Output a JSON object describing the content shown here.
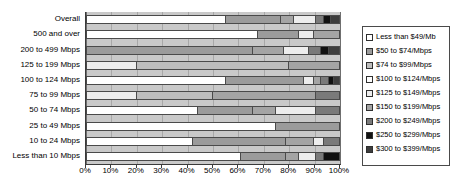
{
  "chart_data": {
    "type": "bar",
    "orientation": "horizontal",
    "stacked": true,
    "normalized": "100%",
    "title": "",
    "xlabel": "",
    "ylabel": "",
    "xlim": [
      0,
      100
    ],
    "grid": true,
    "legend_position": "right",
    "categories": [
      "Overall",
      "500 and over",
      "200 to 499 Mbps",
      "125 to 199 Mbps",
      "100 to 124 Mbps",
      "75 to 99 Mbps",
      "50 to 74 Mbps",
      "25 to 49 Mbps",
      "10 to 24 Mbps",
      "Less than 10 Mbps"
    ],
    "xticklabels": [
      "0%",
      "10%",
      "20%",
      "30%",
      "40%",
      "50%",
      "60%",
      "70%",
      "80%",
      "90%",
      "100%"
    ],
    "xtickvalues": [
      0,
      10,
      20,
      30,
      40,
      50,
      60,
      70,
      80,
      90,
      100
    ],
    "series": [
      {
        "name": "Less than $49/Mb",
        "fill": "f0",
        "values": [
          55,
          68,
          0,
          0,
          55,
          0,
          44,
          75,
          0,
          61
        ]
      },
      {
        "name": "$50 to $74/Mbps",
        "fill": "f1",
        "values": [
          22,
          16,
          66,
          0,
          31,
          0,
          22,
          25,
          42,
          18
        ]
      },
      {
        "name": "$74 to $99/Mbps",
        "fill": "f2",
        "values": [
          0,
          0,
          0,
          20,
          0,
          20,
          0,
          0,
          0,
          0
        ]
      },
      {
        "name": "$100 to $124/Mbps",
        "fill": "f3",
        "values": [
          0,
          0,
          0,
          0,
          0,
          0,
          0,
          0,
          0,
          0
        ]
      },
      {
        "name": "$125 to $149/Mbps",
        "fill": "f4",
        "values": [
          9,
          6,
          10,
          60,
          4,
          30,
          0,
          0,
          37,
          5
        ]
      },
      {
        "name": "$150 to $199/Mbps",
        "fill": "f5",
        "values": [
          5,
          10,
          12,
          20,
          3,
          41,
          9,
          0,
          11,
          7
        ]
      },
      {
        "name": "$200 to $249/Mbps",
        "fill": "f6",
        "values": [
          3,
          0,
          5,
          0,
          3,
          9,
          16,
          0,
          4,
          3
        ]
      },
      {
        "name": "$250 to $299/Mbps",
        "fill": "f7",
        "values": [
          3,
          0,
          3,
          0,
          2,
          0,
          9,
          0,
          6,
          6
        ]
      },
      {
        "name": "$300 to $399/Mbps",
        "fill": "f8",
        "values": [
          3,
          0,
          4,
          0,
          2,
          0,
          0,
          0,
          0,
          0
        ]
      }
    ],
    "bars": [
      {
        "category": "Overall",
        "segments": [
          {
            "s": 0,
            "v": 55
          },
          {
            "s": 1,
            "v": 22
          },
          {
            "s": 5,
            "v": 5
          },
          {
            "s": 4,
            "v": 9
          },
          {
            "s": 6,
            "v": 3
          },
          {
            "s": 7,
            "v": 3
          },
          {
            "s": 8,
            "v": 3
          }
        ]
      },
      {
        "category": "500 and over",
        "segments": [
          {
            "s": 0,
            "v": 68
          },
          {
            "s": 1,
            "v": 16
          },
          {
            "s": 4,
            "v": 6
          },
          {
            "s": 5,
            "v": 10
          }
        ]
      },
      {
        "category": "200 to 499 Mbps",
        "segments": [
          {
            "s": 1,
            "v": 66
          },
          {
            "s": 5,
            "v": 12
          },
          {
            "s": 4,
            "v": 10
          },
          {
            "s": 6,
            "v": 5
          },
          {
            "s": 7,
            "v": 3
          },
          {
            "s": 8,
            "v": 4
          }
        ]
      },
      {
        "category": "125 to 199 Mbps",
        "segments": [
          {
            "s": 4,
            "v": 20
          },
          {
            "s": 2,
            "v": 60
          },
          {
            "s": 5,
            "v": 20
          }
        ]
      },
      {
        "category": "100 to 124 Mbps",
        "segments": [
          {
            "s": 0,
            "v": 55
          },
          {
            "s": 1,
            "v": 31
          },
          {
            "s": 4,
            "v": 4
          },
          {
            "s": 5,
            "v": 3
          },
          {
            "s": 6,
            "v": 3
          },
          {
            "s": 7,
            "v": 2
          },
          {
            "s": 8,
            "v": 2
          }
        ]
      },
      {
        "category": "75 to 99 Mbps",
        "segments": [
          {
            "s": 4,
            "v": 20
          },
          {
            "s": 2,
            "v": 30
          },
          {
            "s": 5,
            "v": 41
          },
          {
            "s": 6,
            "v": 9
          }
        ]
      },
      {
        "category": "50 to 74 Mbps",
        "segments": [
          {
            "s": 0,
            "v": 44
          },
          {
            "s": 1,
            "v": 22
          },
          {
            "s": 5,
            "v": 9
          },
          {
            "s": 4,
            "v": 16
          },
          {
            "s": 6,
            "v": 9
          },
          {
            "s": 7,
            "v": 0
          }
        ]
      },
      {
        "category": "25 to 49 Mbps",
        "segments": [
          {
            "s": 0,
            "v": 75
          },
          {
            "s": 1,
            "v": 25
          }
        ]
      },
      {
        "category": "10 to 24 Mbps",
        "segments": [
          {
            "s": 0,
            "v": 42
          },
          {
            "s": 1,
            "v": 37
          },
          {
            "s": 5,
            "v": 11
          },
          {
            "s": 4,
            "v": 4
          },
          {
            "s": 6,
            "v": 6
          }
        ]
      },
      {
        "category": "Less than 10 Mbps",
        "segments": [
          {
            "s": 0,
            "v": 61
          },
          {
            "s": 1,
            "v": 18
          },
          {
            "s": 5,
            "v": 5
          },
          {
            "s": 4,
            "v": 7
          },
          {
            "s": 6,
            "v": 3
          },
          {
            "s": 7,
            "v": 6
          }
        ]
      }
    ]
  },
  "legend": {
    "items": [
      {
        "label": "Less than $49/Mb",
        "fill": "f0"
      },
      {
        "label": "$50 to $74/Mbps",
        "fill": "f1"
      },
      {
        "label": "$74 to $99/Mbps",
        "fill": "f2"
      },
      {
        "label": "$100 to $124/Mbps",
        "fill": "f3"
      },
      {
        "label": "$125 to $149/Mbps",
        "fill": "f4"
      },
      {
        "label": "$150 to $199/Mbps",
        "fill": "f5"
      },
      {
        "label": "$200 to $249/Mbps",
        "fill": "f6"
      },
      {
        "label": "$250 to $299/Mbps",
        "fill": "f7"
      },
      {
        "label": "$300 to $399/Mbps",
        "fill": "f8"
      }
    ]
  },
  "footer": {
    "artifact_text": ""
  }
}
